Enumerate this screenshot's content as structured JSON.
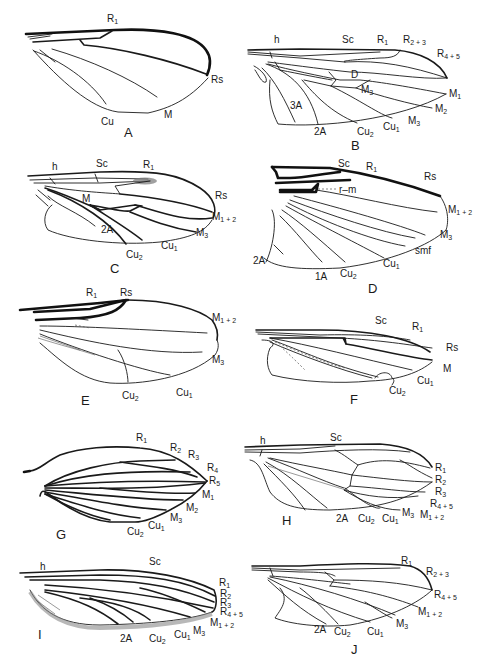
{
  "figure": {
    "panels": [
      {
        "id": "A",
        "label": "A",
        "veins": [
          "R1",
          "Rs",
          "M",
          "Cu"
        ]
      },
      {
        "id": "B",
        "label": "B",
        "veins": [
          "h",
          "Sc",
          "R1",
          "R2+3",
          "R4+5",
          "D",
          "M1",
          "M2",
          "M3",
          "M3",
          "Cu1",
          "Cu2",
          "2A",
          "3A"
        ]
      },
      {
        "id": "C",
        "label": "C",
        "veins": [
          "h",
          "Sc",
          "R1",
          "Rs",
          "M",
          "M1+2",
          "M3",
          "Cu1",
          "Cu2",
          "2A"
        ]
      },
      {
        "id": "D",
        "label": "D",
        "veins": [
          "Sc",
          "R1",
          "Rs",
          "r-m",
          "M1+2",
          "M3",
          "smf",
          "Cu1",
          "Cu2",
          "1A",
          "2A"
        ]
      },
      {
        "id": "E",
        "label": "E",
        "veins": [
          "R1",
          "Rs",
          "M1+2",
          "M3",
          "Cu1",
          "Cu2"
        ]
      },
      {
        "id": "F",
        "label": "F",
        "veins": [
          "Sc",
          "R1",
          "Rs",
          "M",
          "Cu1",
          "Cu2"
        ]
      },
      {
        "id": "G",
        "label": "G",
        "veins": [
          "R1",
          "R2",
          "R3",
          "R4",
          "R5",
          "M1",
          "M2",
          "M3",
          "Cu1",
          "Cu2"
        ]
      },
      {
        "id": "H",
        "label": "H",
        "veins": [
          "h",
          "Sc",
          "R1",
          "R2",
          "R3",
          "R4+5",
          "M1+2",
          "M3",
          "Cu1",
          "Cu2",
          "2A"
        ]
      },
      {
        "id": "I",
        "label": "I",
        "veins": [
          "h",
          "Sc",
          "R1",
          "R2",
          "R3",
          "R4+5",
          "M1+2",
          "M3",
          "Cu1",
          "Cu2",
          "2A"
        ]
      },
      {
        "id": "J",
        "label": "J",
        "veins": [
          "R1",
          "R2+3",
          "R4+5",
          "M1+2",
          "M3",
          "Cu1",
          "Cu2",
          "2A"
        ]
      }
    ]
  },
  "labels": {
    "A": {
      "R1": [
        "R",
        "1"
      ],
      "Rs": [
        "Rs",
        ""
      ],
      "M": [
        "M",
        ""
      ],
      "Cu": [
        "Cu",
        ""
      ]
    },
    "B": {
      "h": [
        "h",
        ""
      ],
      "Sc": [
        "Sc",
        ""
      ],
      "R1": [
        "R",
        "1"
      ],
      "R23": [
        "R",
        "2 + 3"
      ],
      "R45": [
        "R",
        "4 + 5"
      ],
      "D": [
        "D",
        ""
      ],
      "M3a": [
        "M",
        "3"
      ],
      "M1": [
        "M",
        "1"
      ],
      "M2": [
        "M",
        "2"
      ],
      "M3b": [
        "M",
        "3"
      ],
      "Cu1": [
        "Cu",
        "1"
      ],
      "Cu2": [
        "Cu",
        "2"
      ],
      "A2": [
        "2A",
        ""
      ],
      "A3": [
        "3A",
        ""
      ]
    },
    "C": {
      "h": [
        "h",
        ""
      ],
      "Sc": [
        "Sc",
        ""
      ],
      "R1": [
        "R",
        "1"
      ],
      "Rs": [
        "Rs",
        ""
      ],
      "M": [
        "M",
        ""
      ],
      "M12": [
        "M",
        "1 + 2"
      ],
      "M3": [
        "M",
        "3"
      ],
      "Cu1": [
        "Cu",
        "1"
      ],
      "Cu2": [
        "Cu",
        "2"
      ],
      "A2": [
        "2A",
        ""
      ]
    },
    "D": {
      "Sc": [
        "Sc",
        ""
      ],
      "R1": [
        "R",
        "1"
      ],
      "Rs": [
        "Rs",
        ""
      ],
      "rm": [
        "r–m",
        ""
      ],
      "M12": [
        "M",
        "1 + 2"
      ],
      "M3": [
        "M",
        "3"
      ],
      "smf": [
        "smf",
        ""
      ],
      "Cu1": [
        "Cu",
        "1"
      ],
      "Cu2": [
        "Cu",
        "2"
      ],
      "A1": [
        "1A",
        ""
      ],
      "A2": [
        "2A",
        ""
      ]
    },
    "E": {
      "R1": [
        "R",
        "1"
      ],
      "Rs": [
        "Rs",
        ""
      ],
      "M12": [
        "M",
        "1 + 2"
      ],
      "M3": [
        "M",
        "3"
      ],
      "Cu1": [
        "Cu",
        "1"
      ],
      "Cu2": [
        "Cu",
        "2"
      ]
    },
    "F": {
      "Sc": [
        "Sc",
        ""
      ],
      "R1": [
        "R",
        "1"
      ],
      "Rs": [
        "Rs",
        ""
      ],
      "M": [
        "M",
        ""
      ],
      "Cu1": [
        "Cu",
        "1"
      ],
      "Cu2": [
        "Cu",
        "2"
      ]
    },
    "G": {
      "R1": [
        "R",
        "1"
      ],
      "R2": [
        "R",
        "2"
      ],
      "R3": [
        "R",
        "3"
      ],
      "R4": [
        "R",
        "4"
      ],
      "R5": [
        "R",
        "5"
      ],
      "M1": [
        "M",
        "1"
      ],
      "M2": [
        "M",
        "2"
      ],
      "M3": [
        "M",
        "3"
      ],
      "Cu1": [
        "Cu",
        "1"
      ],
      "Cu2": [
        "Cu",
        "2"
      ]
    },
    "H": {
      "h": [
        "h",
        ""
      ],
      "Sc": [
        "Sc",
        ""
      ],
      "R1": [
        "R",
        "1"
      ],
      "R2": [
        "R",
        "2"
      ],
      "R3": [
        "R",
        "3"
      ],
      "R45": [
        "R",
        "4 + 5"
      ],
      "M12": [
        "M",
        "1 + 2"
      ],
      "M3": [
        "M",
        "3"
      ],
      "Cu1": [
        "Cu",
        "1"
      ],
      "Cu2": [
        "Cu",
        "2"
      ],
      "A2": [
        "2A",
        ""
      ]
    },
    "I": {
      "h": [
        "h",
        ""
      ],
      "Sc": [
        "Sc",
        ""
      ],
      "R1": [
        "R",
        "1"
      ],
      "R2": [
        "R",
        "2"
      ],
      "R3": [
        "R",
        "3"
      ],
      "R45": [
        "R",
        "4 + 5"
      ],
      "M12": [
        "M",
        "1 + 2"
      ],
      "M3": [
        "M",
        "3"
      ],
      "Cu1": [
        "Cu",
        "1"
      ],
      "Cu2": [
        "Cu",
        "2"
      ],
      "A2": [
        "2A",
        ""
      ]
    },
    "J": {
      "R1": [
        "R",
        "1"
      ],
      "R23": [
        "R",
        "2 + 3"
      ],
      "R45": [
        "R",
        "4 + 5"
      ],
      "M12": [
        "M",
        "1 + 2"
      ],
      "M3": [
        "M",
        "3"
      ],
      "Cu1": [
        "Cu",
        "1"
      ],
      "Cu2": [
        "Cu",
        "2"
      ],
      "A2": [
        "2A",
        ""
      ]
    }
  }
}
